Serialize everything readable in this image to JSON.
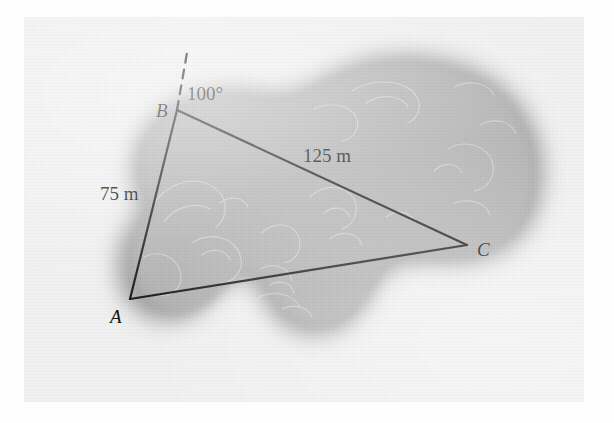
{
  "figure": {
    "kind": "surveying-triangle-over-lake",
    "caption_present": false,
    "background": {
      "paper_color": "#f2f2f2",
      "blob_fill": "#b4b4b4",
      "blob_halo": "#8f8f8f",
      "contour_color": "#e8e8e8"
    },
    "line_color": "#1a1a1a"
  },
  "labels": {
    "vertex_a": "A",
    "vertex_b": "B",
    "vertex_c": "C",
    "side_ab": "75 m",
    "side_bc": "125 m",
    "angle_b": "100°"
  },
  "geometry": {
    "vertices": {
      "A": {
        "x": 130,
        "y": 299
      },
      "B": {
        "x": 177,
        "y": 110
      },
      "C": {
        "x": 467,
        "y": 245
      }
    },
    "bearing_line": {
      "from": {
        "x": 177,
        "y": 110
      },
      "to": {
        "x": 188,
        "y": 47
      },
      "style": "dashed"
    },
    "measurements": {
      "AB_m": 75,
      "BC_m": 125,
      "angle_at_B_deg": 100
    }
  }
}
